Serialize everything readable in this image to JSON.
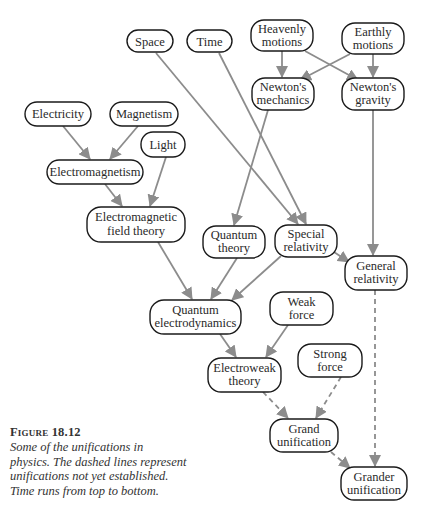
{
  "figure": {
    "label": "Figure 18.12",
    "caption": "Some of the unifications in physics. The dashed lines represent unifications not yet established. Time runs from top to bottom.",
    "caption_lines": [
      "Some of the unifications in",
      "physics. The dashed lines represent",
      "unifications not yet established.",
      "Time runs from top to bottom."
    ]
  },
  "colors": {
    "edge": "#8c8c8c",
    "node_border": "#1a1a1a",
    "node_fill": "#ffffff",
    "text": "#2a2a2a"
  },
  "nodes": {
    "space": {
      "lines": [
        "Space"
      ]
    },
    "time": {
      "lines": [
        "Time"
      ]
    },
    "heavenly_motions": {
      "lines": [
        "Heavenly",
        "motions"
      ]
    },
    "earthly_motions": {
      "lines": [
        "Earthly",
        "motions"
      ]
    },
    "newtons_mechanics": {
      "lines": [
        "Newton's",
        "mechanics"
      ]
    },
    "newtons_gravity": {
      "lines": [
        "Newton's",
        "gravity"
      ]
    },
    "electricity": {
      "lines": [
        "Electricity"
      ]
    },
    "magnetism": {
      "lines": [
        "Magnetism"
      ]
    },
    "light": {
      "lines": [
        "Light"
      ]
    },
    "electromagnetism": {
      "lines": [
        "Electromagnetism"
      ]
    },
    "em_field_theory": {
      "lines": [
        "Electromagnetic",
        "field theory"
      ]
    },
    "quantum_theory": {
      "lines": [
        "Quantum",
        "theory"
      ]
    },
    "special_relativity": {
      "lines": [
        "Special",
        "relativity"
      ]
    },
    "general_relativity": {
      "lines": [
        "General",
        "relativity"
      ]
    },
    "qed": {
      "lines": [
        "Quantum",
        "electrodynamics"
      ]
    },
    "weak_force": {
      "lines": [
        "Weak",
        "force"
      ]
    },
    "electroweak_theory": {
      "lines": [
        "Electroweak",
        "theory"
      ]
    },
    "strong_force": {
      "lines": [
        "Strong",
        "force"
      ]
    },
    "grand_unification": {
      "lines": [
        "Grand",
        "unification"
      ]
    },
    "grander_unification": {
      "lines": [
        "Grander",
        "unification"
      ]
    }
  },
  "edges": [
    {
      "from": "Heavenly motions",
      "to": "Newton's mechanics",
      "style": "solid"
    },
    {
      "from": "Heavenly motions",
      "to": "Newton's gravity",
      "style": "solid"
    },
    {
      "from": "Earthly motions",
      "to": "Newton's mechanics",
      "style": "solid"
    },
    {
      "from": "Earthly motions",
      "to": "Newton's gravity",
      "style": "solid"
    },
    {
      "from": "Electricity",
      "to": "Electromagnetism",
      "style": "solid"
    },
    {
      "from": "Magnetism",
      "to": "Electromagnetism",
      "style": "solid"
    },
    {
      "from": "Electromagnetism",
      "to": "Electromagnetic field theory",
      "style": "solid"
    },
    {
      "from": "Light",
      "to": "Electromagnetic field theory",
      "style": "solid"
    },
    {
      "from": "Space",
      "to": "Special relativity",
      "style": "solid"
    },
    {
      "from": "Time",
      "to": "Special relativity",
      "style": "solid"
    },
    {
      "from": "Newton's mechanics",
      "to": "Quantum theory",
      "style": "solid"
    },
    {
      "from": "Newton's gravity",
      "to": "General relativity",
      "style": "solid"
    },
    {
      "from": "Special relativity",
      "to": "General relativity",
      "style": "solid"
    },
    {
      "from": "Electromagnetic field theory",
      "to": "Quantum electrodynamics",
      "style": "solid"
    },
    {
      "from": "Quantum theory",
      "to": "Quantum electrodynamics",
      "style": "solid"
    },
    {
      "from": "Special relativity",
      "to": "Quantum electrodynamics",
      "style": "solid"
    },
    {
      "from": "Quantum electrodynamics",
      "to": "Electroweak theory",
      "style": "solid"
    },
    {
      "from": "Weak force",
      "to": "Electroweak theory",
      "style": "solid"
    },
    {
      "from": "Electroweak theory",
      "to": "Grand unification",
      "style": "dashed"
    },
    {
      "from": "Strong force",
      "to": "Grand unification",
      "style": "dashed"
    },
    {
      "from": "Grand unification",
      "to": "Grander unification",
      "style": "dashed"
    },
    {
      "from": "General relativity",
      "to": "Grander unification",
      "style": "dashed"
    }
  ]
}
